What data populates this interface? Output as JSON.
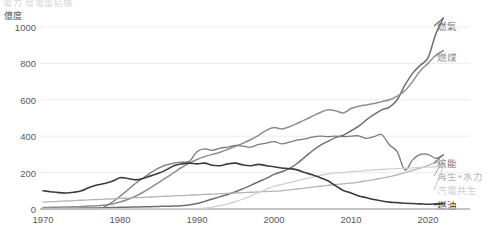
{
  "title_clipped": "電力 發電量結構",
  "axes": {
    "y_unit": "億度",
    "y_ticks": [
      "0",
      "200",
      "400",
      "600",
      "800",
      "1000"
    ],
    "y_tick_values": [
      0,
      200,
      400,
      600,
      800,
      1000
    ],
    "x_ticks": [
      "1970",
      "1980",
      "1990",
      "2000",
      "2010",
      "2020"
    ],
    "x_tick_values": [
      1970,
      1980,
      1990,
      2000,
      2010,
      2020
    ]
  },
  "legend": [
    {
      "key": "gas",
      "label": "燃氣",
      "color": "#6f6f6f"
    },
    {
      "key": "coal",
      "label": "燃煤",
      "color": "#8e8e8e"
    },
    {
      "key": "nuclear",
      "label": "核能",
      "color": "#7a7a7a"
    },
    {
      "key": "renew",
      "label": "再生+水力",
      "color": "#b4b4b4"
    },
    {
      "key": "cogen",
      "label": "汽電共生",
      "color": "#cfcfcf"
    },
    {
      "key": "oil",
      "label": "燃油",
      "color": "#3c3c3c"
    }
  ],
  "chart_data": {
    "type": "line",
    "title": "電力 發電量結構",
    "xlabel": "",
    "ylabel": "億度",
    "xlim": [
      1970,
      2022
    ],
    "ylim": [
      0,
      1080
    ],
    "grid": true,
    "legend_position": "right-inline",
    "x": [
      1970,
      1971,
      1972,
      1973,
      1974,
      1975,
      1976,
      1977,
      1978,
      1979,
      1980,
      1981,
      1982,
      1983,
      1984,
      1985,
      1986,
      1987,
      1988,
      1989,
      1990,
      1991,
      1992,
      1993,
      1994,
      1995,
      1996,
      1997,
      1998,
      1999,
      2000,
      2001,
      2002,
      2003,
      2004,
      2005,
      2006,
      2007,
      2008,
      2009,
      2010,
      2011,
      2012,
      2013,
      2014,
      2015,
      2016,
      2017,
      2018,
      2019,
      2020,
      2021,
      2022
    ],
    "series": [
      {
        "name": "燃氣",
        "key": "gas",
        "color": "#6f6f6f",
        "values": [
          2,
          2,
          3,
          3,
          4,
          5,
          6,
          6,
          7,
          8,
          9,
          10,
          11,
          12,
          13,
          14,
          15,
          16,
          18,
          22,
          30,
          42,
          55,
          68,
          80,
          95,
          112,
          130,
          150,
          168,
          190,
          205,
          222,
          250,
          285,
          320,
          350,
          372,
          392,
          405,
          430,
          455,
          490,
          520,
          545,
          560,
          600,
          680,
          745,
          790,
          830,
          960,
          1050
        ]
      },
      {
        "name": "燃煤",
        "key": "coal",
        "color": "#8e8e8e",
        "values": [
          8,
          9,
          10,
          11,
          12,
          14,
          16,
          18,
          22,
          28,
          38,
          52,
          70,
          92,
          118,
          145,
          172,
          200,
          228,
          252,
          272,
          288,
          300,
          312,
          328,
          345,
          362,
          382,
          405,
          432,
          448,
          440,
          452,
          470,
          490,
          510,
          530,
          545,
          540,
          528,
          552,
          565,
          572,
          580,
          590,
          600,
          620,
          650,
          700,
          760,
          800,
          845,
          870
        ]
      },
      {
        "name": "核能",
        "key": "nuclear",
        "color": "#7a7a7a",
        "values": [
          0,
          0,
          0,
          0,
          0,
          0,
          0,
          0,
          12,
          38,
          70,
          105,
          140,
          170,
          200,
          225,
          242,
          252,
          258,
          262,
          315,
          330,
          322,
          335,
          340,
          350,
          345,
          340,
          355,
          362,
          370,
          358,
          368,
          378,
          385,
          395,
          400,
          398,
          400,
          398,
          400,
          402,
          388,
          398,
          408,
          352,
          315,
          215,
          270,
          300,
          300,
          278,
          298
        ]
      },
      {
        "name": "再生+水力",
        "key": "renew",
        "color": "#b4b4b4",
        "values": [
          38,
          40,
          42,
          44,
          46,
          48,
          50,
          52,
          54,
          56,
          58,
          60,
          62,
          64,
          66,
          68,
          70,
          72,
          74,
          76,
          78,
          80,
          82,
          84,
          86,
          88,
          90,
          92,
          94,
          96,
          98,
          100,
          105,
          110,
          115,
          120,
          125,
          130,
          135,
          138,
          142,
          148,
          155,
          162,
          170,
          178,
          188,
          200,
          212,
          225,
          240,
          255,
          270
        ]
      },
      {
        "name": "汽電共生",
        "key": "cogen",
        "color": "#cfcfcf",
        "values": [
          0,
          0,
          0,
          0,
          0,
          0,
          0,
          0,
          0,
          0,
          0,
          0,
          0,
          0,
          0,
          0,
          0,
          0,
          0,
          0,
          2,
          5,
          10,
          18,
          28,
          40,
          55,
          72,
          90,
          108,
          125,
          135,
          145,
          155,
          165,
          175,
          185,
          192,
          198,
          200,
          205,
          208,
          212,
          215,
          218,
          220,
          222,
          224,
          226,
          228,
          230,
          232,
          234
        ],
        "note": "series partially hidden behind others"
      },
      {
        "name": "燃油",
        "key": "oil",
        "color": "#3c3c3c",
        "values": [
          100,
          95,
          90,
          88,
          92,
          100,
          118,
          132,
          140,
          152,
          172,
          168,
          160,
          168,
          182,
          196,
          215,
          238,
          248,
          252,
          248,
          252,
          240,
          238,
          248,
          252,
          242,
          238,
          245,
          238,
          232,
          225,
          222,
          215,
          200,
          188,
          172,
          155,
          128,
          102,
          88,
          72,
          62,
          52,
          44,
          38,
          35,
          32,
          30,
          28,
          26,
          28,
          30
        ]
      }
    ]
  }
}
